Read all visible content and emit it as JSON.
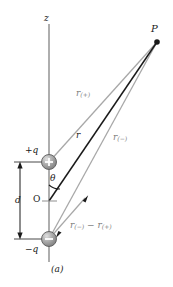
{
  "figure": {
    "caption": "(a)",
    "axis_label": "z",
    "point_label": "P",
    "origin_label": "O",
    "angle_label": "θ",
    "separation_label": "d",
    "positive_charge_label": "+q",
    "negative_charge_label": "−q",
    "positive_charge_glyph": "+",
    "negative_charge_glyph": "−",
    "distance_r_label": "r",
    "distance_rplus_base": "r",
    "distance_rplus_sub": "(+)",
    "distance_rminus_base": "r",
    "distance_rminus_sub": "(−)",
    "difference_label_part1_base": "r",
    "difference_label_part1_sub": "(−)",
    "difference_label_operator": " − ",
    "difference_label_part2_base": "r",
    "difference_label_part2_sub": "(+)"
  },
  "colors": {
    "axis_gray": "#9a9a9a",
    "ray_gray": "#a8a8a8",
    "main_ray_black": "#1a1a1a",
    "charge_fill": "#9e9e9e",
    "charge_highlight": "#d6d6d6",
    "charge_stroke": "#4a4a4a",
    "text_black": "#1a1a1a",
    "text_gray": "#7d7d7d",
    "background": "#ffffff"
  },
  "geometry": {
    "point_p": {
      "x": 157,
      "y": 42
    },
    "positive_charge": {
      "x": 49,
      "y": 162
    },
    "origin": {
      "x": 49,
      "y": 201
    },
    "negative_charge": {
      "x": 49,
      "y": 239
    },
    "axis_top": {
      "x": 49,
      "y": 24
    },
    "axis_bottom": {
      "x": 49,
      "y": 262
    },
    "dimension_line_x": 20,
    "dimension_top_y": 162,
    "dimension_bottom_y": 239
  }
}
